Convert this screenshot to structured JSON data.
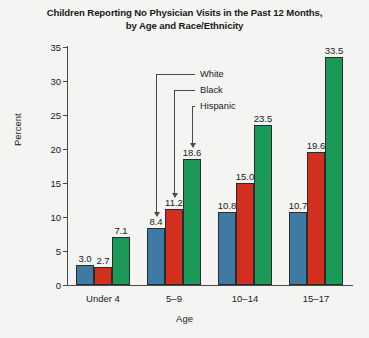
{
  "chart_data": {
    "type": "bar",
    "title": "Children Reporting No Physician Visits in the Past 12 Months, by Age and Race/Ethnicity",
    "title_line1": "Children Reporting No Physician Visits in the Past 12 Months,",
    "title_line2": "by Age and Race/Ethnicity",
    "xlabel": "Age",
    "ylabel": "Percent",
    "ylim": [
      0,
      35
    ],
    "yticks": [
      0,
      5,
      10,
      15,
      20,
      25,
      30,
      35
    ],
    "ytick_labels": [
      "0",
      "5",
      "10",
      "15",
      "20",
      "25",
      "30",
      "35"
    ],
    "grid": false,
    "legend_position": "inside-callouts",
    "categories": [
      "Under 4",
      "5–9",
      "10–14",
      "15–17"
    ],
    "series": [
      {
        "name": "White",
        "color": "#3d7ba5",
        "values": [
          3.0,
          8.4,
          10.8,
          10.7
        ],
        "labels": [
          "3.0",
          "8.4",
          "10.8",
          "10.7"
        ]
      },
      {
        "name": "Black",
        "color": "#d32f1e",
        "values": [
          2.7,
          11.2,
          15.0,
          19.6
        ],
        "labels": [
          "2.7",
          "11.2",
          "15.0",
          "19.6"
        ]
      },
      {
        "name": "Hispanic",
        "color": "#1a9957",
        "values": [
          7.1,
          18.6,
          23.5,
          33.5
        ],
        "labels": [
          "7.1",
          "18.6",
          "23.5",
          "33.5"
        ]
      }
    ],
    "annotations": [
      {
        "text": "White",
        "points_to": "White bar, 5–9 group"
      },
      {
        "text": "Black",
        "points_to": "Black bar, 5–9 group"
      },
      {
        "text": "Hispanic",
        "points_to": "Hispanic bar, 5–9 group"
      }
    ]
  },
  "colors": {
    "white_series": "#3d7ba5",
    "black_series": "#d32f1e",
    "hispanic_series": "#1a9957",
    "axis": "#4a4a4a",
    "text": "#1a1a1a",
    "background": "#f4f4f2"
  }
}
